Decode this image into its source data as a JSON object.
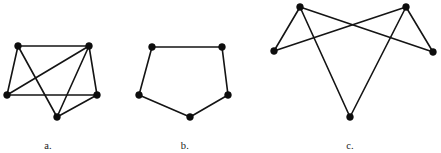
{
  "figure": {
    "background_color": "#ffffff",
    "edge_color": "#141414",
    "vertex_color": "#0d0d0d",
    "edge_width": 1.6,
    "vertex_radius": 3.4
  },
  "chart_data": {
    "type": "diagram",
    "title": "",
    "subtitle": "",
    "xlabel": "",
    "ylabel": "",
    "grid": false,
    "legend": "none",
    "graphs": [
      {
        "id": "graph-a",
        "caption": "a.",
        "caption_x": 48,
        "caption_y": 140,
        "vertex_count": 5,
        "edge_count": 8,
        "degree_sequence": [
          4,
          4,
          3,
          3,
          2
        ],
        "vertices": [
          {
            "id": "a1",
            "label": "",
            "x": 18,
            "y": 46
          },
          {
            "id": "a2",
            "label": "",
            "x": 89,
            "y": 46
          },
          {
            "id": "a3",
            "label": "",
            "x": 7,
            "y": 95
          },
          {
            "id": "a4",
            "label": "",
            "x": 97,
            "y": 95
          },
          {
            "id": "a5",
            "label": "",
            "x": 57,
            "y": 117
          }
        ],
        "edges": [
          {
            "from": "a1",
            "to": "a2"
          },
          {
            "from": "a1",
            "to": "a3"
          },
          {
            "from": "a1",
            "to": "a5"
          },
          {
            "from": "a2",
            "to": "a3"
          },
          {
            "from": "a2",
            "to": "a4"
          },
          {
            "from": "a2",
            "to": "a5"
          },
          {
            "from": "a3",
            "to": "a4"
          },
          {
            "from": "a4",
            "to": "a5"
          }
        ]
      },
      {
        "id": "graph-b",
        "caption": "b.",
        "caption_x": 185,
        "caption_y": 140,
        "vertex_count": 5,
        "edge_count": 5,
        "degree_sequence": [
          2,
          2,
          2,
          2,
          2
        ],
        "vertices": [
          {
            "id": "b1",
            "label": "",
            "x": 152,
            "y": 47
          },
          {
            "id": "b2",
            "label": "",
            "x": 222,
            "y": 47
          },
          {
            "id": "b3",
            "label": "",
            "x": 228,
            "y": 95
          },
          {
            "id": "b4",
            "label": "",
            "x": 190,
            "y": 117
          },
          {
            "id": "b5",
            "label": "",
            "x": 139,
            "y": 95
          }
        ],
        "edges": [
          {
            "from": "b1",
            "to": "b2"
          },
          {
            "from": "b2",
            "to": "b3"
          },
          {
            "from": "b3",
            "to": "b4"
          },
          {
            "from": "b4",
            "to": "b5"
          },
          {
            "from": "b5",
            "to": "b1"
          }
        ]
      },
      {
        "id": "graph-c",
        "caption": "c.",
        "caption_x": 350,
        "caption_y": 140,
        "vertex_count": 5,
        "edge_count": 6,
        "degree_sequence": [
          3,
          3,
          2,
          2,
          2
        ],
        "vertices": [
          {
            "id": "c1",
            "label": "",
            "x": 300,
            "y": 7
          },
          {
            "id": "c2",
            "label": "",
            "x": 406,
            "y": 7
          },
          {
            "id": "c3",
            "label": "",
            "x": 274,
            "y": 51
          },
          {
            "id": "c4",
            "label": "",
            "x": 433,
            "y": 52
          },
          {
            "id": "c5",
            "label": "",
            "x": 350,
            "y": 117
          }
        ],
        "edges": [
          {
            "from": "c1",
            "to": "c3"
          },
          {
            "from": "c1",
            "to": "c4"
          },
          {
            "from": "c1",
            "to": "c5"
          },
          {
            "from": "c2",
            "to": "c3"
          },
          {
            "from": "c2",
            "to": "c4"
          },
          {
            "from": "c2",
            "to": "c5"
          }
        ]
      }
    ]
  }
}
